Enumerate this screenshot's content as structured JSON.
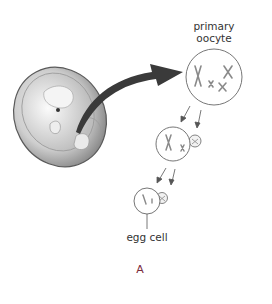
{
  "figure": {
    "panel_letter": "A",
    "panel_letter_color": "#7a2a3a",
    "labels": {
      "primary_oocyte_line1": "primary",
      "primary_oocyte_line2": "oocyte",
      "egg_cell": "egg cell"
    },
    "elements": [
      {
        "id": "embryo",
        "description": "fetus illustration"
      },
      {
        "id": "curved-arrow",
        "description": "arrow from embryo to primary oocyte"
      },
      {
        "id": "primary-oocyte",
        "description": "cell with 4 chromosomes"
      },
      {
        "id": "secondary-oocyte",
        "description": "cell with 2 chromosomes and polar body"
      },
      {
        "id": "egg-cell",
        "description": "cell with single chromatids and polar body"
      }
    ],
    "colors": {
      "line": "#555555",
      "arrow": "#3a3a3a",
      "embryo_fill": "#cfcfcf",
      "chromosome": "#8a8a8a"
    }
  }
}
